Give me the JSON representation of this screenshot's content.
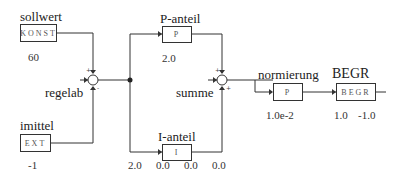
{
  "blocks": {
    "sollwert": {
      "label": "sollwert",
      "type": "KONST",
      "params": "60"
    },
    "imittel": {
      "label": "imittel",
      "type": "EXT",
      "params": "-1"
    },
    "p_anteil": {
      "label": "P-anteil",
      "type": "P",
      "params": "2.0"
    },
    "i_anteil": {
      "label": "I-anteil",
      "type": "I",
      "params": [
        "2.0",
        "0.0",
        "0.0",
        "0.0"
      ]
    },
    "normierung": {
      "label": "normierung",
      "type": "P",
      "params": "1.0e-2"
    },
    "begr": {
      "label": "BEGR",
      "type": "BEGR",
      "params": [
        "1.0",
        "-1.0"
      ]
    }
  },
  "junctions": {
    "regelab": {
      "label": "regelab",
      "signs": [
        "+",
        "-"
      ]
    },
    "summe": {
      "label": "summe",
      "signs": [
        "+",
        "+"
      ]
    }
  },
  "colors": {
    "line": "#333333",
    "background": "#ffffff"
  }
}
